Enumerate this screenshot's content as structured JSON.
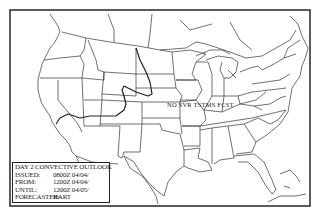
{
  "map": {
    "type": "convective-outlook",
    "region": "Continental United States",
    "frame_color": "#333333",
    "boundary_color": "#333333",
    "outlook_line_color": "#222222",
    "annotation": "NO SVR TSTMS FCST"
  },
  "legend": {
    "title": "DAY 2 CONVECTIVE OUTLOOK",
    "rows": [
      {
        "key": "ISSUED:",
        "value": "0800Z 04/04/"
      },
      {
        "key": "FROM:",
        "value": "1200Z 04/04/"
      },
      {
        "key": "UNTIL:",
        "value": "1200Z 04/05/"
      },
      {
        "key": "FORECASTER:",
        "value": "HART"
      }
    ]
  }
}
